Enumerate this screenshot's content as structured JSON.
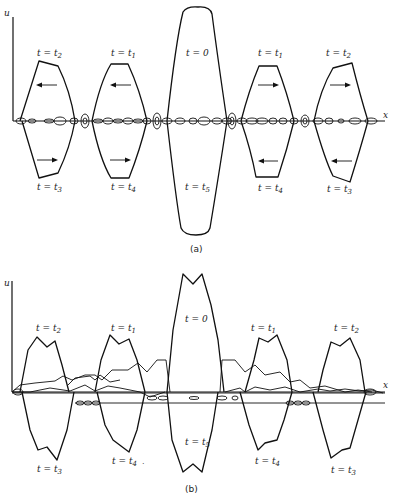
{
  "figure": {
    "panels": [
      {
        "id": "a",
        "caption": "(a)",
        "axis_y_label": "u",
        "axis_x_label": "x",
        "labels_top": [
          "t = t2",
          "t = t1",
          "t = 0",
          "t = t1",
          "t = t2"
        ],
        "labels_bottom": [
          "t = t3",
          "t = t4",
          "t = t5",
          "t = t4",
          "t = t3"
        ],
        "arrows_top": [
          "left",
          "left",
          "right",
          "right"
        ],
        "arrows_bottom": [
          "right",
          "right",
          "left",
          "left"
        ]
      },
      {
        "id": "b",
        "caption": "(b)",
        "axis_y_label": "u",
        "axis_x_label": "x",
        "labels_top": [
          "t = t2",
          "t = t1",
          "t = 0",
          "t = t1",
          "t = t2"
        ],
        "labels_bottom": [
          "t = t3",
          "t = t4",
          "t = t5",
          "t = t4",
          "t = t3"
        ]
      }
    ],
    "text": {
      "a_top_0": "t = t",
      "a_top_0_sub": "2",
      "a_top_1": "t = t",
      "a_top_1_sub": "1",
      "a_top_2": "t = 0",
      "a_top_3": "t = t",
      "a_top_3_sub": "1",
      "a_top_4": "t = t",
      "a_top_4_sub": "2",
      "a_bot_0": "t = t",
      "a_bot_0_sub": "3",
      "a_bot_1": "t = t",
      "a_bot_1_sub": "4",
      "a_bot_2": "t = t",
      "a_bot_2_sub": "5",
      "a_bot_3": "t = t",
      "a_bot_3_sub": "4",
      "a_bot_4": "t = t",
      "a_bot_4_sub": "3",
      "a_caption": "(a)",
      "a_u": "u",
      "a_x": "x",
      "b_top_0": "t = t",
      "b_top_0_sub": "2",
      "b_top_1": "t = t",
      "b_top_1_sub": "1",
      "b_top_2": "t = 0",
      "b_top_3": "t = t",
      "b_top_3_sub": "1",
      "b_top_4": "t = t",
      "b_top_4_sub": "2",
      "b_bot_0": "t = t",
      "b_bot_0_sub": "3",
      "b_bot_1": "t = t",
      "b_bot_1_sub": "4",
      "b_bot_2": "t = t",
      "b_bot_2_sub": "5",
      "b_bot_3": "t = t",
      "b_bot_3_sub": "4",
      "b_bot_4": "t = t",
      "b_bot_4_sub": "3",
      "b_caption": "(b)",
      "b_u": "u",
      "b_x": "x"
    }
  }
}
